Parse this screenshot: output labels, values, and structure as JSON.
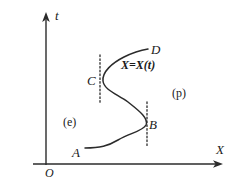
{
  "figure": {
    "background_color": "#ffffff",
    "ink_color": "#2b2b2b",
    "axes": {
      "vertical": {
        "name": "t-axis",
        "label": "t",
        "x": 46,
        "y_top": 13,
        "y_bottom": 165,
        "arrow": "up"
      },
      "horizontal": {
        "name": "X-axis",
        "label": "X",
        "y": 164,
        "x_left": 33,
        "x_right": 222,
        "arrow": "right"
      },
      "origin_label": "O"
    },
    "curve": {
      "name": "shock-trajectory-curve",
      "equation_label": "X=X(t)",
      "description": "S-shaped monotone-in-t curve running from A at lower left, bending right to a rightmost turning point B, back left to a leftmost turning point C, then up and right to D",
      "path": "M 85 148 C 100 148 108 146 118 140 C 130 133 143 131 146 125 C 149 118 138 110 128 102 C 117 94 104 90 103 81 C 102 72 112 63 124 57 C 134 52 142 50 148 49"
    },
    "points": [
      {
        "id": "A",
        "label": "A",
        "x": 85,
        "y": 148
      },
      {
        "id": "B",
        "label": "B",
        "x": 146,
        "y": 125
      },
      {
        "id": "C",
        "label": "C",
        "x": 103,
        "y": 81
      },
      {
        "id": "D",
        "label": "D",
        "x": 148,
        "y": 49
      }
    ],
    "dotted_lines": [
      {
        "name": "dotted-line-C",
        "x": 100,
        "y_top": 55,
        "y_bottom": 104
      },
      {
        "name": "dotted-line-B",
        "x": 147,
        "y_top": 102,
        "y_bottom": 147
      }
    ],
    "region_labels": [
      {
        "name": "region-label-e",
        "text": "(e)",
        "x": 63,
        "y": 116
      },
      {
        "name": "region-label-p",
        "text": "(p)",
        "x": 172,
        "y": 87
      }
    ]
  }
}
